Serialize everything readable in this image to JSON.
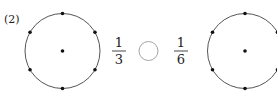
{
  "problem": {
    "label": "(2)"
  },
  "left_fraction": {
    "numerator": "1",
    "denominator": "3"
  },
  "right_fraction": {
    "numerator": "1",
    "denominator": "6"
  },
  "answer_blank": {
    "shape": "circle",
    "value": ""
  },
  "figures": [
    {
      "name": "left-circle",
      "points_on_circle": 6,
      "has_center_dot": true
    },
    {
      "name": "right-circle",
      "points_on_circle": 6,
      "has_center_dot": true
    }
  ],
  "colors": {
    "stroke": "#555555",
    "dot": "#111111",
    "blank_stroke": "#9a9a9a"
  }
}
